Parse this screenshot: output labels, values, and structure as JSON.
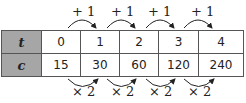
{
  "top_labels": [
    "+ 1",
    "+ 1",
    "+ 1",
    "+ 1"
  ],
  "bottom_labels": [
    "× 2",
    "× 2",
    "× 2",
    "× 2"
  ],
  "rows": [
    {
      "header": "t",
      "values": [
        "0",
        "1",
        "2",
        "3",
        "4"
      ]
    },
    {
      "header": "c",
      "values": [
        "15",
        "30",
        "60",
        "120",
        "240"
      ]
    }
  ]
}
